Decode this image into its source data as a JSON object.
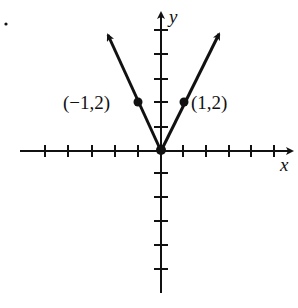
{
  "figure": {
    "marker_dot": ".",
    "axes": {
      "x_label": "x",
      "y_label": "y"
    },
    "points": [
      {
        "label": "(−1,2)",
        "x": -1,
        "y": 2
      },
      {
        "label": "(1,2)",
        "x": 1,
        "y": 2
      }
    ],
    "function": "y = 2|x|",
    "colors": {
      "ink": "#111111",
      "background": "#ffffff"
    }
  }
}
